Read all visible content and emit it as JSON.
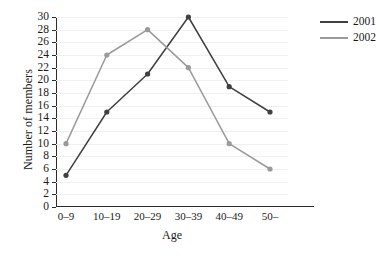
{
  "chart_data": {
    "type": "line",
    "title": "",
    "xlabel": "Age",
    "ylabel": "Number of members",
    "categories": [
      "0–9",
      "10–19",
      "20–29",
      "30–39",
      "40–49",
      "50–"
    ],
    "ylim": [
      0,
      30
    ],
    "ytick_step": 2,
    "yticks": [
      0,
      2,
      4,
      6,
      8,
      10,
      12,
      14,
      16,
      18,
      20,
      22,
      24,
      26,
      28,
      30
    ],
    "ytick_labels": [
      "0",
      "2",
      "4",
      "6",
      "8",
      "10",
      "12",
      "14",
      "16",
      "18",
      "20",
      "22",
      "24",
      "26",
      "28",
      "30"
    ],
    "grid": true,
    "legend_position": "right",
    "markers": true,
    "series": [
      {
        "name": "2001",
        "color": "#404040",
        "values": [
          5,
          15,
          21,
          30,
          19,
          15
        ]
      },
      {
        "name": "2002",
        "color": "#9a9a9a",
        "values": [
          10,
          24,
          28,
          22,
          10,
          6
        ]
      }
    ]
  },
  "legend": {
    "entries": [
      {
        "label": "2001",
        "color": "#404040"
      },
      {
        "label": "2002",
        "color": "#9a9a9a"
      }
    ]
  },
  "axes": {
    "x_title": "Age",
    "y_title": "Number of members"
  }
}
